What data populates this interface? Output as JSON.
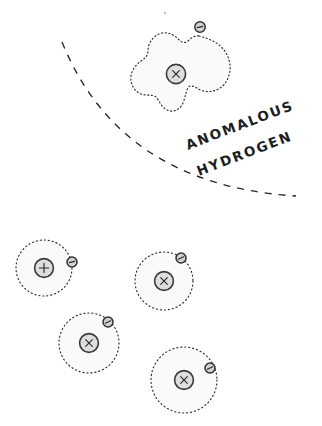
{
  "figure": {
    "background_color": "#ffffff",
    "width": 322,
    "height": 426,
    "ink_color": "#262626",
    "orbit_fill_color": "#fafafa",
    "nucleus_fill_color": "#dedede",
    "electron_fill_color": "#d2d2d2"
  },
  "labels": {
    "anomalous": "ANOMALOUS",
    "hydrogen": "HYDROGEN",
    "rotation_degrees": -20
  },
  "divider": {
    "name": "dashed-boundary-arc",
    "style": "dashed",
    "start_point": [
      62,
      42
    ],
    "end_point": [
      296,
      196
    ],
    "control_point": [
      120,
      185
    ]
  },
  "atoms": [
    {
      "id": "anomalous-hydrogen",
      "kind": "anomalous",
      "orbit_shape": "blob",
      "nucleus_glyph": "x",
      "nucleus_center": [
        176,
        74
      ],
      "nucleus_radius": 10,
      "electron_center": [
        200,
        27
      ],
      "electron_radius": 5.2,
      "electron_glyph": "minus"
    },
    {
      "id": "normal-hydrogen-1",
      "kind": "normal",
      "orbit_shape": "circle",
      "nucleus_glyph": "+",
      "nucleus_center": [
        44,
        268
      ],
      "nucleus_radius": 9.5,
      "orbit_radius": 28,
      "electron_center": [
        72,
        262
      ],
      "electron_radius": 5,
      "electron_glyph": "minus"
    },
    {
      "id": "normal-hydrogen-2",
      "kind": "normal",
      "orbit_shape": "circle",
      "nucleus_glyph": "x",
      "nucleus_center": [
        164,
        281
      ],
      "nucleus_radius": 9.5,
      "orbit_radius": 29,
      "electron_center": [
        181,
        258
      ],
      "electron_radius": 5,
      "electron_glyph": "minus"
    },
    {
      "id": "normal-hydrogen-3",
      "kind": "normal",
      "orbit_shape": "circle",
      "nucleus_glyph": "x",
      "nucleus_center": [
        89,
        343
      ],
      "nucleus_radius": 9.5,
      "orbit_radius": 30,
      "electron_center": [
        108,
        322
      ],
      "electron_radius": 5,
      "electron_glyph": "minus"
    },
    {
      "id": "normal-hydrogen-4",
      "kind": "normal",
      "orbit_shape": "circle",
      "nucleus_glyph": "x",
      "nucleus_center": [
        184,
        380
      ],
      "nucleus_radius": 9.5,
      "orbit_radius": 33,
      "electron_center": [
        210,
        368
      ],
      "electron_radius": 5,
      "electron_glyph": "minus"
    }
  ]
}
